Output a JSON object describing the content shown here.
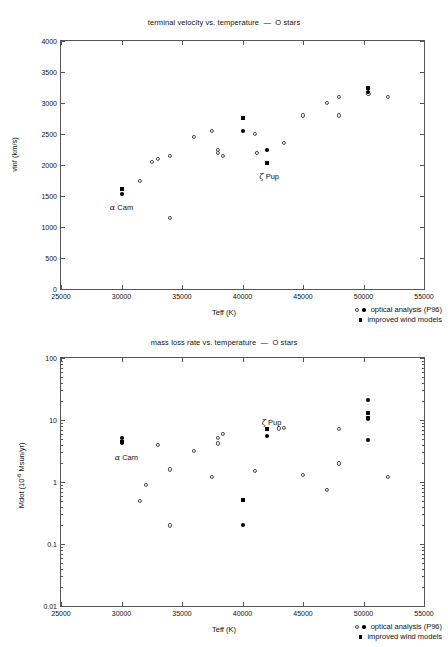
{
  "chart_data": [
    {
      "type": "scatter",
      "id": "terminal-velocity",
      "title": "terminal velocity vs. temperature  —  O stars",
      "xlabel": "Teff (K)",
      "ylabel": "vinf (km/s)",
      "xlim": [
        25000,
        55000
      ],
      "ylim": [
        0,
        4000
      ],
      "xticks": [
        25000,
        30000,
        35000,
        40000,
        45000,
        50000,
        55000
      ],
      "yticks": [
        0,
        500,
        1000,
        1500,
        2000,
        2500,
        3000,
        3500,
        4000
      ],
      "yscale": "linear",
      "grid": false,
      "legend_position": "bottom-right",
      "series": [
        {
          "name": "optical analysis (P96)",
          "marker": "open-circle",
          "points": [
            [
              31500,
              1750
            ],
            [
              32500,
              2050
            ],
            [
              33000,
              2100
            ],
            [
              34000,
              2150
            ],
            [
              34000,
              1150
            ],
            [
              36000,
              2450
            ],
            [
              37500,
              2550
            ],
            [
              38000,
              2250
            ],
            [
              38000,
              2200
            ],
            [
              38400,
              2150
            ],
            [
              41000,
              2500
            ],
            [
              41200,
              2200
            ],
            [
              43400,
              2350
            ],
            [
              45000,
              2800
            ],
            [
              47000,
              3000
            ],
            [
              48000,
              3100
            ],
            [
              48000,
              2800
            ],
            [
              50400,
              3150
            ],
            [
              52000,
              3100
            ]
          ]
        },
        {
          "name": "optical analysis (P96) filled",
          "marker": "filled-circle",
          "points": [
            [
              30000,
              1540
            ],
            [
              40000,
              2550
            ],
            [
              42000,
              2250
            ],
            [
              50400,
              3180
            ]
          ]
        },
        {
          "name": "improved wind models",
          "marker": "filled-square",
          "points": [
            [
              30000,
              1620
            ],
            [
              40000,
              2760
            ],
            [
              42000,
              2040
            ],
            [
              50400,
              3250
            ]
          ]
        }
      ],
      "annotations": [
        {
          "text": "α Cam",
          "x": 30000,
          "y": 1380
        },
        {
          "text": "ζ Pup",
          "x": 42200,
          "y": 1880
        }
      ]
    },
    {
      "type": "scatter",
      "id": "mass-loss-rate",
      "title": "mass loss rate vs. temperature  —  O stars",
      "xlabel": "Teff (K)",
      "ylabel": "Mdot (10⁻⁶ Msun/yr)",
      "ylabel_base": "Mdot (10",
      "ylabel_exp": "-6",
      "ylabel_tail": " Msun/yr)",
      "xlim": [
        25000,
        55000
      ],
      "ylim": [
        0.01,
        100
      ],
      "xticks": [
        25000,
        30000,
        35000,
        40000,
        45000,
        50000,
        55000
      ],
      "yticks": [
        0.01,
        0.1,
        1,
        10,
        100
      ],
      "ytick_labels": [
        "0.01",
        "0.1",
        "1",
        "10",
        "100"
      ],
      "yscale": "log",
      "grid": false,
      "legend_position": "bottom-right",
      "series": [
        {
          "name": "optical analysis (P96)",
          "marker": "open-circle",
          "points": [
            [
              31500,
              0.5
            ],
            [
              32000,
              0.9
            ],
            [
              33000,
              4.0
            ],
            [
              34000,
              1.6
            ],
            [
              34000,
              0.2
            ],
            [
              36000,
              3.2
            ],
            [
              37500,
              1.2
            ],
            [
              38000,
              5.2
            ],
            [
              38000,
              4.2
            ],
            [
              38400,
              6.0
            ],
            [
              41000,
              1.5
            ],
            [
              43400,
              7.4
            ],
            [
              43000,
              7.3
            ],
            [
              45000,
              1.3
            ],
            [
              47000,
              0.75
            ],
            [
              48000,
              7.2
            ],
            [
              48000,
              2.0
            ],
            [
              52000,
              1.2
            ]
          ]
        },
        {
          "name": "optical analysis (P96) filled",
          "marker": "filled-circle",
          "points": [
            [
              30000,
              5.2
            ],
            [
              30000,
              4.2
            ],
            [
              40000,
              0.2
            ],
            [
              42000,
              5.6
            ],
            [
              50400,
              21.0
            ],
            [
              50400,
              10.2
            ],
            [
              50400,
              4.8
            ]
          ]
        },
        {
          "name": "improved wind models",
          "marker": "filled-square",
          "points": [
            [
              30000,
              4.5
            ],
            [
              40000,
              0.52
            ],
            [
              42000,
              7.2
            ],
            [
              50400,
              13.0
            ],
            [
              50400,
              10.6
            ]
          ]
        }
      ],
      "annotations": [
        {
          "text": "α Cam",
          "x": 30400,
          "y": 2.9
        },
        {
          "text": "ζ Pup",
          "x": 42400,
          "y": 10.6
        }
      ]
    }
  ],
  "legend": {
    "entries": [
      {
        "label": "optical analysis (P96)",
        "markers": [
          "open-circle",
          "filled-circle"
        ]
      },
      {
        "label": "improved wind models",
        "markers": [
          "filled-square"
        ]
      }
    ]
  },
  "colors": {
    "axis": "#555555",
    "marker_open": "#444444",
    "marker_filled": "#000000",
    "text": "#111111",
    "background": "#ffffff"
  }
}
